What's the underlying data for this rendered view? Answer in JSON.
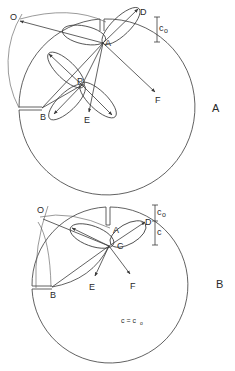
{
  "panels": [
    {
      "id": "A",
      "panel_label": "A",
      "points": {
        "O": "O",
        "A": "A",
        "D": "D",
        "F": "F",
        "P": "P",
        "B": "B",
        "E": "E"
      },
      "dimension_label": "c",
      "dimension_sub": "o"
    },
    {
      "id": "B",
      "panel_label": "B",
      "points": {
        "O": "O",
        "A": "A",
        "C": "C",
        "D": "D",
        "E": "E",
        "F": "F",
        "B": "B"
      },
      "dimension_label_top": "c",
      "dimension_sub_top": "o",
      "dimension_label_bottom": "c",
      "equation_lhs": "c = c",
      "equation_sub": "o"
    }
  ],
  "colors": {
    "stroke": "#3a3a3a",
    "background": "#ffffff"
  }
}
